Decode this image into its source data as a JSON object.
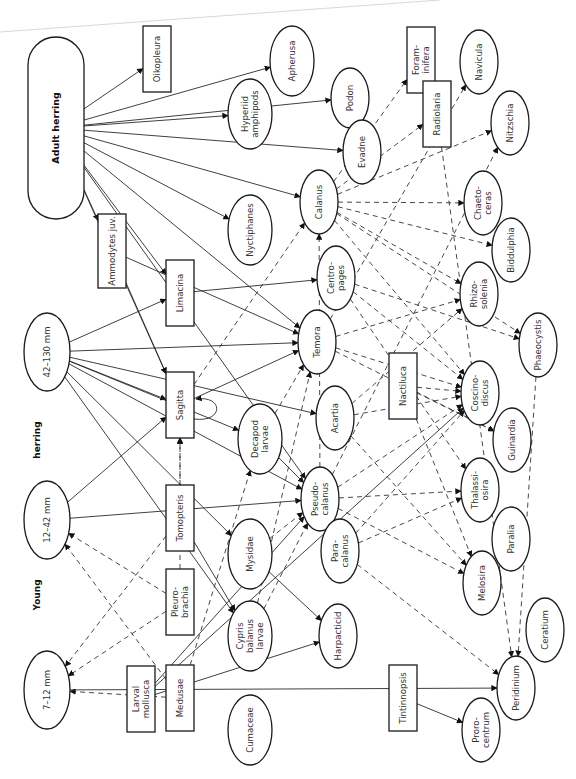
{
  "diagram": {
    "orientation": "rotated-90-ccw",
    "group_labels": [
      {
        "id": "young",
        "text": "Young",
        "x": 40,
        "y": 595
      },
      {
        "id": "herring",
        "text": "herring",
        "x": 40,
        "y": 440
      }
    ],
    "nodes": [
      {
        "id": "adult-herring",
        "label": [
          "Adult herring"
        ],
        "shape": "stadium",
        "x": 56,
        "y": 128,
        "w": 56,
        "h": 182,
        "bold": true
      },
      {
        "id": "oikopleura",
        "label": [
          "Oikopleura"
        ],
        "shape": "rect",
        "x": 157,
        "y": 59,
        "w": 28,
        "h": 66
      },
      {
        "id": "apherusa",
        "label": [
          "Apherusa"
        ],
        "shape": "ellipse",
        "x": 292,
        "y": 61,
        "rx": 22,
        "ry": 35
      },
      {
        "id": "hyperiid-amphipods",
        "label": [
          "Hyperiid",
          "amphipods"
        ],
        "shape": "ellipse",
        "x": 250,
        "y": 114,
        "rx": 22,
        "ry": 35
      },
      {
        "id": "podon",
        "label": [
          "Podon"
        ],
        "shape": "ellipse",
        "x": 350,
        "y": 98,
        "rx": 19,
        "ry": 30
      },
      {
        "id": "evadne",
        "label": [
          "Evadne"
        ],
        "shape": "ellipse",
        "x": 362,
        "y": 152,
        "rx": 19,
        "ry": 32
      },
      {
        "id": "nyctiphanes",
        "label": [
          "Nyctiphanes"
        ],
        "shape": "ellipse",
        "x": 250,
        "y": 230,
        "rx": 22,
        "ry": 35
      },
      {
        "id": "calanus",
        "label": [
          "Calanus"
        ],
        "shape": "ellipse",
        "x": 319,
        "y": 202,
        "rx": 19,
        "ry": 32
      },
      {
        "id": "foraminifera",
        "label": [
          "Foram-",
          "inifera"
        ],
        "shape": "rect",
        "x": 421,
        "y": 60,
        "w": 28,
        "h": 66
      },
      {
        "id": "radiolaria",
        "label": [
          "Radiolaria"
        ],
        "shape": "rect",
        "x": 437,
        "y": 114,
        "w": 28,
        "h": 66
      },
      {
        "id": "navicula",
        "label": [
          "Navicula"
        ],
        "shape": "ellipse",
        "x": 479,
        "y": 62,
        "rx": 19,
        "ry": 32
      },
      {
        "id": "nitzschia",
        "label": [
          "Nitzschia"
        ],
        "shape": "ellipse",
        "x": 510,
        "y": 123,
        "rx": 19,
        "ry": 32
      },
      {
        "id": "chaetoceras",
        "label": [
          "Chaeto-",
          "ceras"
        ],
        "shape": "ellipse",
        "x": 483,
        "y": 203,
        "rx": 19,
        "ry": 32
      },
      {
        "id": "biddulphia",
        "label": [
          "Biddulphia"
        ],
        "shape": "ellipse",
        "x": 511,
        "y": 250,
        "rx": 19,
        "ry": 32
      },
      {
        "id": "ammodytes-juv",
        "label": [
          "Ammodytes juv."
        ],
        "shape": "rect",
        "x": 112,
        "y": 251,
        "w": 28,
        "h": 74
      },
      {
        "id": "limacina",
        "label": [
          "Limacina"
        ],
        "shape": "rect",
        "x": 180,
        "y": 293,
        "w": 28,
        "h": 66
      },
      {
        "id": "centropages",
        "label": [
          "Centro-",
          "pages"
        ],
        "shape": "ellipse",
        "x": 336,
        "y": 278,
        "rx": 19,
        "ry": 32
      },
      {
        "id": "temora",
        "label": [
          "Temora"
        ],
        "shape": "ellipse",
        "x": 317,
        "y": 342,
        "rx": 19,
        "ry": 32
      },
      {
        "id": "rhizosolenia",
        "label": [
          "Rhizo-",
          "solenia"
        ],
        "shape": "ellipse",
        "x": 479,
        "y": 294,
        "rx": 19,
        "ry": 32
      },
      {
        "id": "phaeocystis",
        "label": [
          "Phaeocystis"
        ],
        "shape": "ellipse",
        "x": 538,
        "y": 345,
        "rx": 19,
        "ry": 32
      },
      {
        "id": "size-42-130",
        "label": [
          "42–130 mm"
        ],
        "shape": "ellipse",
        "x": 47,
        "y": 352,
        "rx": 23,
        "ry": 39
      },
      {
        "id": "sagitta",
        "label": [
          "Sagitta"
        ],
        "shape": "rect",
        "x": 180,
        "y": 405,
        "w": 28,
        "h": 66
      },
      {
        "id": "decapod-larvae",
        "label": [
          "Decapod",
          "larvae"
        ],
        "shape": "ellipse",
        "x": 260,
        "y": 439,
        "rx": 22,
        "ry": 35
      },
      {
        "id": "acartia",
        "label": [
          "Acartia"
        ],
        "shape": "ellipse",
        "x": 335,
        "y": 418,
        "rx": 19,
        "ry": 32
      },
      {
        "id": "nactiluca",
        "label": [
          "Nactiluca"
        ],
        "shape": "rect",
        "x": 403,
        "y": 386,
        "w": 28,
        "h": 66
      },
      {
        "id": "coscinodiscus",
        "label": [
          "Coscino-",
          "discus"
        ],
        "shape": "ellipse",
        "x": 480,
        "y": 393,
        "rx": 19,
        "ry": 32
      },
      {
        "id": "guinardia",
        "label": [
          "Guinardia"
        ],
        "shape": "ellipse",
        "x": 512,
        "y": 440,
        "rx": 19,
        "ry": 32
      },
      {
        "id": "size-12-42",
        "label": [
          "12–42 mm"
        ],
        "shape": "ellipse",
        "x": 47,
        "y": 520,
        "rx": 23,
        "ry": 39
      },
      {
        "id": "pseudocalanus",
        "label": [
          "Pseudo-",
          "calanus"
        ],
        "shape": "ellipse",
        "x": 320,
        "y": 499,
        "rx": 19,
        "ry": 32
      },
      {
        "id": "paracalanus",
        "label": [
          "Para-",
          "calanus"
        ],
        "shape": "ellipse",
        "x": 340,
        "y": 551,
        "rx": 19,
        "ry": 32
      },
      {
        "id": "thalassiosira",
        "label": [
          "Thalassi-",
          "osira"
        ],
        "shape": "ellipse",
        "x": 480,
        "y": 490,
        "rx": 19,
        "ry": 32
      },
      {
        "id": "paralia",
        "label": [
          "Paralia"
        ],
        "shape": "ellipse",
        "x": 511,
        "y": 539,
        "rx": 19,
        "ry": 32
      },
      {
        "id": "melosira",
        "label": [
          "Melosira"
        ],
        "shape": "ellipse",
        "x": 482,
        "y": 583,
        "rx": 19,
        "ry": 32
      },
      {
        "id": "tomopteris",
        "label": [
          "Tomopteris"
        ],
        "shape": "rect",
        "x": 180,
        "y": 518,
        "w": 28,
        "h": 66
      },
      {
        "id": "mysidae",
        "label": [
          "Mysidae"
        ],
        "shape": "ellipse",
        "x": 250,
        "y": 554,
        "rx": 22,
        "ry": 35
      },
      {
        "id": "pleurobrachia",
        "label": [
          "Pleuro-",
          "brachia"
        ],
        "shape": "rect",
        "x": 180,
        "y": 602,
        "w": 28,
        "h": 66
      },
      {
        "id": "cypris-balanus-larvae",
        "label": [
          "Cypris",
          "balanus",
          "larvae"
        ],
        "shape": "ellipse",
        "x": 250,
        "y": 636,
        "rx": 22,
        "ry": 35
      },
      {
        "id": "harpacticid",
        "label": [
          "Harpacticid"
        ],
        "shape": "ellipse",
        "x": 338,
        "y": 636,
        "rx": 19,
        "ry": 32
      },
      {
        "id": "ceratium",
        "label": [
          "Ceratium"
        ],
        "shape": "ellipse",
        "x": 545,
        "y": 630,
        "rx": 19,
        "ry": 32
      },
      {
        "id": "size-7-12",
        "label": [
          "7–12 mm"
        ],
        "shape": "ellipse",
        "x": 47,
        "y": 690,
        "rx": 23,
        "ry": 39
      },
      {
        "id": "medusae",
        "label": [
          "Medusae"
        ],
        "shape": "rect",
        "x": 180,
        "y": 698,
        "w": 28,
        "h": 66
      },
      {
        "id": "cumaceae",
        "label": [
          "Cumaceae"
        ],
        "shape": "ellipse",
        "x": 250,
        "y": 730,
        "rx": 22,
        "ry": 35
      },
      {
        "id": "larval-mollusca",
        "label": [
          "Larval",
          "mollusca"
        ],
        "shape": "rect",
        "x": 141,
        "y": 699,
        "w": 28,
        "h": 66,
        "xoff": 0
      },
      {
        "id": "tintinnopsis",
        "label": [
          "Tintinnopsis"
        ],
        "shape": "rect",
        "x": 403,
        "y": 698,
        "w": 28,
        "h": 66
      },
      {
        "id": "peridinium",
        "label": [
          "Peridinium"
        ],
        "shape": "ellipse",
        "x": 516,
        "y": 688,
        "rx": 19,
        "ry": 32
      },
      {
        "id": "prorocentrum",
        "label": [
          "Proro-",
          "centrum"
        ],
        "shape": "ellipse",
        "x": 481,
        "y": 730,
        "rx": 19,
        "ry": 32
      }
    ],
    "edges": {
      "solid": [
        [
          "adult-herring",
          "oikopleura"
        ],
        [
          "adult-herring",
          "apherusa"
        ],
        [
          "adult-herring",
          "hyperiid-amphipods"
        ],
        [
          "adult-herring",
          "evadne"
        ],
        [
          "adult-herring",
          "podon"
        ],
        [
          "adult-herring",
          "calanus"
        ],
        [
          "adult-herring",
          "nyctiphanes"
        ],
        [
          "adult-herring",
          "ammodytes-juv"
        ],
        [
          "adult-herring",
          "limacina"
        ],
        [
          "adult-herring",
          "temora"
        ],
        [
          "adult-herring",
          "pseudocalanus"
        ],
        [
          "adult-herring",
          "sagitta"
        ],
        [
          "ammodytes-juv",
          "temora"
        ],
        [
          "ammodytes-juv",
          "sagitta"
        ],
        [
          "size-42-130",
          "limacina"
        ],
        [
          "size-42-130",
          "temora"
        ],
        [
          "size-42-130",
          "acartia"
        ],
        [
          "size-42-130",
          "sagitta"
        ],
        [
          "size-42-130",
          "decapod-larvae"
        ],
        [
          "size-42-130",
          "mysidae"
        ],
        [
          "size-42-130",
          "cypris-balanus-larvae"
        ],
        [
          "size-42-130",
          "pseudocalanus"
        ],
        [
          "limacina",
          "centropages"
        ],
        [
          "sagitta",
          "temora"
        ],
        [
          "sagitta",
          "sagitta"
        ],
        [
          "decapod-larvae",
          "pseudocalanus"
        ],
        [
          "size-12-42",
          "sagitta"
        ],
        [
          "size-12-42",
          "pseudocalanus"
        ],
        [
          "tomopteris",
          "cypris-balanus-larvae"
        ],
        [
          "mysidae",
          "harpacticid"
        ],
        [
          "size-7-12",
          "peridinium"
        ],
        [
          "larval-mollusca",
          "pseudocalanus"
        ],
        [
          "larval-mollusca",
          "harpacticid"
        ],
        [
          "larval-mollusca",
          "coscinodiscus"
        ],
        [
          "tintinnopsis",
          "prorocentrum"
        ]
      ],
      "dashed": [
        [
          "calanus",
          "nitzschia"
        ],
        [
          "calanus",
          "chaetoceras"
        ],
        [
          "calanus",
          "biddulphia"
        ],
        [
          "calanus",
          "rhizosolenia"
        ],
        [
          "calanus",
          "coscinodiscus"
        ],
        [
          "calanus",
          "phaeocystis"
        ],
        [
          "calanus",
          "radiolaria"
        ],
        [
          "calanus",
          "foraminifera"
        ],
        [
          "temora",
          "rhizosolenia"
        ],
        [
          "temora",
          "coscinodiscus"
        ],
        [
          "temora",
          "guinardia"
        ],
        [
          "temora",
          "navicula"
        ],
        [
          "centropages",
          "phaeocystis"
        ],
        [
          "centropages",
          "coscinodiscus"
        ],
        [
          "centropages",
          "thalassiosira"
        ],
        [
          "acartia",
          "coscinodiscus"
        ],
        [
          "acartia",
          "melosira"
        ],
        [
          "acartia",
          "rhizosolenia"
        ],
        [
          "pseudocalanus",
          "coscinodiscus"
        ],
        [
          "pseudocalanus",
          "thalassiosira"
        ],
        [
          "pseudocalanus",
          "melosira"
        ],
        [
          "pseudocalanus",
          "nitzschia"
        ],
        [
          "paracalanus",
          "coscinodiscus"
        ],
        [
          "paracalanus",
          "thalassiosira"
        ],
        [
          "paracalanus",
          "peridinium"
        ],
        [
          "nactiluca",
          "coscinodiscus"
        ],
        [
          "nactiluca",
          "guinardia"
        ],
        [
          "nactiluca",
          "melosira"
        ],
        [
          "radiolaria",
          "peridinium"
        ],
        [
          "phaeocystis",
          "peridinium"
        ],
        [
          "medusae",
          "size-7-12"
        ],
        [
          "pleurobrachia",
          "size-7-12"
        ],
        [
          "pleurobrachia",
          "size-12-42"
        ],
        [
          "tomopteris",
          "size-7-12"
        ],
        [
          "medusae",
          "size-12-42"
        ],
        [
          "medusae",
          "decapod-larvae"
        ],
        [
          "tomopteris",
          "sagitta"
        ],
        [
          "cypris-balanus-larvae",
          "pseudocalanus"
        ],
        [
          "mysidae",
          "pseudocalanus"
        ],
        [
          "decapod-larvae",
          "temora"
        ],
        [
          "pleurobrachia",
          "sagitta"
        ],
        [
          "cypris-balanus-larvae",
          "temora"
        ],
        [
          "pseudocalanus",
          "calanus"
        ],
        [
          "sagitta",
          "calanus"
        ]
      ]
    }
  }
}
